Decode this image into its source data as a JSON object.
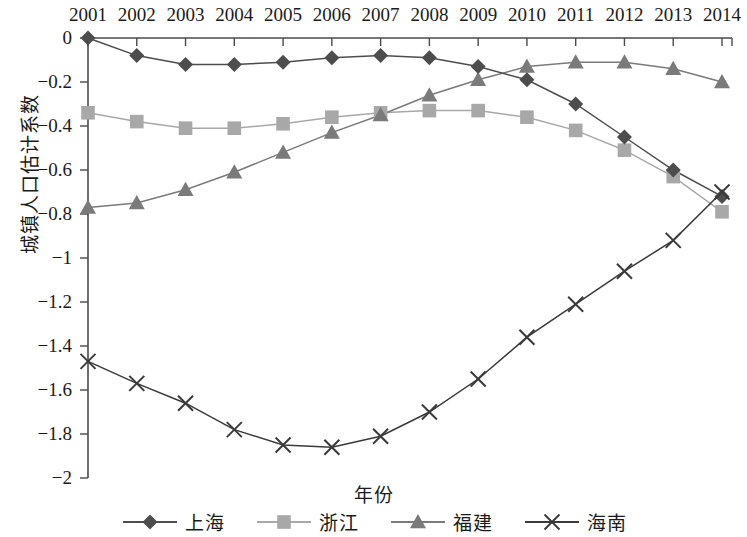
{
  "chart_data": {
    "type": "line",
    "title": "",
    "xlabel": "年份",
    "ylabel": "城镇人口估计系数",
    "x": [
      2001,
      2002,
      2003,
      2004,
      2005,
      2006,
      2007,
      2008,
      2009,
      2010,
      2011,
      2012,
      2013,
      2014
    ],
    "categories": [
      "2001",
      "2002",
      "2003",
      "2004",
      "2005",
      "2006",
      "2007",
      "2008",
      "2009",
      "2010",
      "2011",
      "2012",
      "2013",
      "2014"
    ],
    "xlim": [
      2001,
      2014
    ],
    "ylim": [
      -2,
      0
    ],
    "yticks": [
      0,
      -0.2,
      -0.4,
      -0.6,
      -0.8,
      -1,
      -1.2,
      -1.4,
      -1.6,
      -1.8,
      -2
    ],
    "ytick_labels": [
      "0",
      "−0.2",
      "−0.4",
      "−0.6",
      "−0.8",
      "−1",
      "−1.2",
      "−1.4",
      "−1.6",
      "−1.8",
      "−2"
    ],
    "grid": false,
    "legend_position": "bottom",
    "xaxis_position": "top",
    "series": [
      {
        "name": "上海",
        "marker": "diamond",
        "color": "#4d4d4d",
        "values": [
          0.0,
          -0.08,
          -0.12,
          -0.12,
          -0.11,
          -0.09,
          -0.08,
          -0.09,
          -0.13,
          -0.19,
          -0.3,
          -0.45,
          -0.6,
          -0.72
        ]
      },
      {
        "name": "浙江",
        "marker": "square",
        "color": "#a8a8a8",
        "values": [
          -0.34,
          -0.38,
          -0.41,
          -0.41,
          -0.39,
          -0.36,
          -0.34,
          -0.33,
          -0.33,
          -0.36,
          -0.42,
          -0.51,
          -0.63,
          -0.79
        ]
      },
      {
        "name": "福建",
        "marker": "triangle",
        "color": "#7a7a7a",
        "values": [
          -0.77,
          -0.75,
          -0.69,
          -0.61,
          -0.52,
          -0.43,
          -0.35,
          -0.26,
          -0.19,
          -0.13,
          -0.11,
          -0.11,
          -0.14,
          -0.2
        ]
      },
      {
        "name": "海南",
        "marker": "cross",
        "color": "#3a3a3a",
        "values": [
          -1.47,
          -1.57,
          -1.66,
          -1.78,
          -1.85,
          -1.86,
          -1.81,
          -1.7,
          -1.55,
          -1.36,
          -1.21,
          -1.06,
          -0.92,
          -0.7
        ]
      }
    ]
  },
  "axis": {
    "y_title": "城镇人口估计系数",
    "x_title": "年份"
  },
  "legend": {
    "items": [
      {
        "label": "上海",
        "marker": "diamond-marker-icon"
      },
      {
        "label": "浙江",
        "marker": "square-marker-icon"
      },
      {
        "label": "福建",
        "marker": "triangle-marker-icon"
      },
      {
        "label": "海南",
        "marker": "cross-marker-icon"
      }
    ]
  }
}
